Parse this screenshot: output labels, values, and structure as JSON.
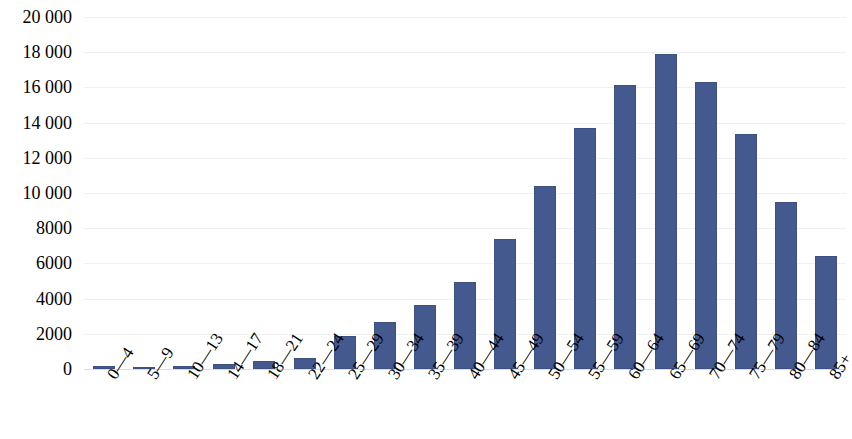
{
  "chart_data": {
    "type": "bar",
    "title": "",
    "subtitle": "",
    "xlabel": "",
    "ylabel": "",
    "legend": [],
    "legend_position": "none",
    "grid": true,
    "grid_axis": "y",
    "ylim": [
      0,
      20000
    ],
    "ytick_step": 2000,
    "ytick_labels": [
      "20 000",
      "18 000",
      "16 000",
      "14 000",
      "12 000",
      "10 000",
      "8000",
      "6000",
      "4000",
      "2000",
      "0"
    ],
    "ytick_values": [
      20000,
      18000,
      16000,
      14000,
      12000,
      10000,
      8000,
      6000,
      4000,
      2000,
      0
    ],
    "categories": [
      "0—4",
      "5—9",
      "10—13",
      "14—17",
      "18—21",
      "22—24",
      "25—29",
      "30—34",
      "35—39",
      "40—44",
      "45—49",
      "50—54",
      "55—59",
      "60—64",
      "65—69",
      "70—74",
      "75—79",
      "80—84",
      "85+"
    ],
    "values": [
      170,
      70,
      150,
      310,
      480,
      650,
      1850,
      2650,
      3650,
      4950,
      7400,
      10400,
      13700,
      16150,
      17900,
      16300,
      13350,
      9500,
      6400
    ],
    "bar_color": "#44598e",
    "bar_border_color": "#3d5183",
    "gridline_color": "#f0f0f0",
    "axis_line_color": "#dcdcdc",
    "background_color": "#ffffff"
  }
}
